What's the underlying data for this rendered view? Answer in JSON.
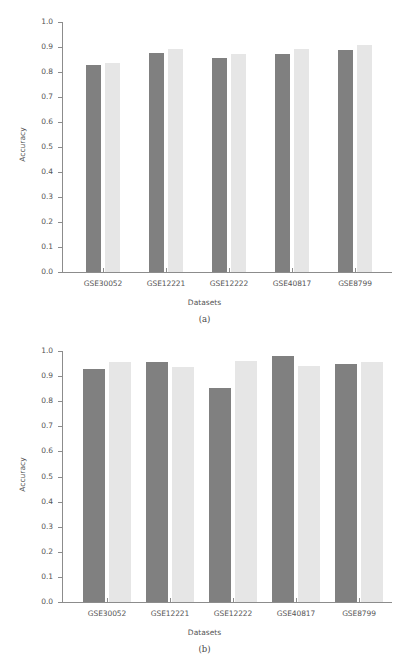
{
  "figure": {
    "type": "grouped-bar-figure",
    "panels": [
      {
        "caption": "(a)",
        "xlabel": "Datasets",
        "ylabel": "Accuracy"
      },
      {
        "caption": "(b)",
        "xlabel": "Datasets",
        "ylabel": "Accuracy"
      }
    ],
    "ytick_labels": [
      "1.0",
      "0.9",
      "0.8",
      "0.7",
      "0.6",
      "0.5",
      "0.4",
      "0.3",
      "0.2",
      "0.1",
      "0.0"
    ],
    "colors": {
      "series_0": "#808080",
      "series_1": "#e6e6e6",
      "axis": "#8c8c8c",
      "text": "#555555",
      "background": "#ffffff"
    }
  },
  "chart_data": [
    {
      "type": "bar",
      "title": "(a)",
      "xlabel": "Datasets",
      "ylabel": "Accuracy",
      "ylim": [
        0.0,
        1.0
      ],
      "yticks": [
        0.0,
        0.1,
        0.2,
        0.3,
        0.4,
        0.5,
        0.6,
        0.7,
        0.8,
        0.9,
        1.0
      ],
      "grid": false,
      "legend": "none",
      "categories": [
        "GSE30052",
        "GSE12221",
        "GSE12222",
        "GSE40817",
        "GSE8799"
      ],
      "series": [
        {
          "name": "series-1",
          "color": "#808080",
          "values": [
            0.828,
            0.878,
            0.855,
            0.873,
            0.888
          ]
        },
        {
          "name": "series-2",
          "color": "#e6e6e6",
          "values": [
            0.837,
            0.893,
            0.873,
            0.893,
            0.908
          ]
        }
      ]
    },
    {
      "type": "bar",
      "title": "(b)",
      "xlabel": "Datasets",
      "ylabel": "Accuracy",
      "ylim": [
        0.0,
        1.0
      ],
      "yticks": [
        0.0,
        0.1,
        0.2,
        0.3,
        0.4,
        0.5,
        0.6,
        0.7,
        0.8,
        0.9,
        1.0
      ],
      "grid": false,
      "legend": "none",
      "categories": [
        "GSE30052",
        "GSE12221",
        "GSE12222",
        "GSE40817",
        "GSE8799"
      ],
      "series": [
        {
          "name": "series-1",
          "color": "#808080",
          "values": [
            0.928,
            0.956,
            0.853,
            0.981,
            0.948
          ]
        },
        {
          "name": "series-2",
          "color": "#e6e6e6",
          "values": [
            0.958,
            0.935,
            0.962,
            0.939,
            0.957
          ]
        }
      ]
    }
  ]
}
